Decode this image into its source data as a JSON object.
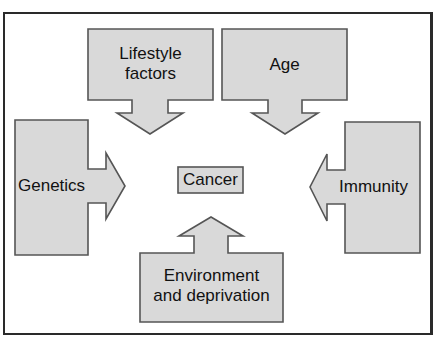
{
  "caption": "",
  "diagram": {
    "center": {
      "label": "Cancer"
    },
    "factors": [
      {
        "id": "lifestyle",
        "label_line1": "Lifestyle",
        "label_line2": "factors",
        "direction": "down"
      },
      {
        "id": "age",
        "label": "Age",
        "direction": "down"
      },
      {
        "id": "genetics",
        "label": "Genetics",
        "direction": "right"
      },
      {
        "id": "immunity",
        "label": "Immunity",
        "direction": "left"
      },
      {
        "id": "environment",
        "label_line1": "Environment",
        "label_line2": "and deprivation",
        "direction": "up"
      }
    ]
  },
  "colors": {
    "fill": "#d9d9d9",
    "stroke": "#555555",
    "frame": "#2a2a2a"
  }
}
